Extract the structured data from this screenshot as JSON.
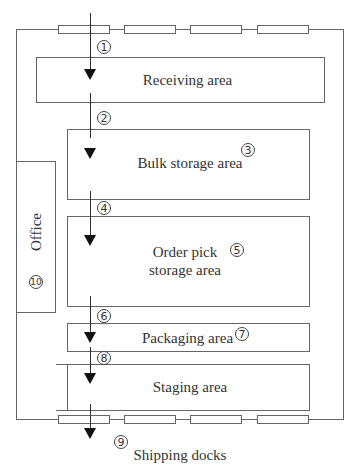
{
  "diagram": {
    "areas": [
      {
        "id": "receiving",
        "label": "Receiving area",
        "step": "1"
      },
      {
        "id": "bulk",
        "label": "Bulk storage area",
        "step": "3"
      },
      {
        "id": "orderpick",
        "label_line1": "Order pick",
        "label_line2": "storage area",
        "step": "5"
      },
      {
        "id": "packaging",
        "label": "Packaging area",
        "step": "7"
      },
      {
        "id": "staging",
        "label": "Staging area",
        "step": "8"
      },
      {
        "id": "office",
        "label": "Office",
        "step": "10"
      }
    ],
    "steps": [
      "1",
      "2",
      "3",
      "4",
      "5",
      "6",
      "7",
      "8",
      "9",
      "10"
    ],
    "shipping_label": "Shipping docks",
    "receiving_docks": 4,
    "shipping_docks": 4
  }
}
